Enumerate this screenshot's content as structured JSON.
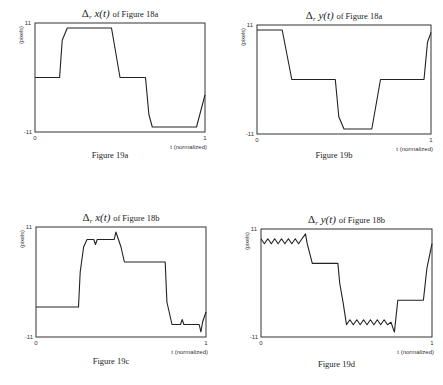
{
  "chart_data": [
    {
      "type": "line",
      "title": "Δr x(t) of Figure 18a",
      "title_var": "x",
      "title_ref": "of Figure 18a",
      "caption": "Figure 19a",
      "xlabel": "t (normalized)",
      "ylabel": "(pixels)",
      "xlim": [
        0,
        1
      ],
      "ylim": [
        -11,
        11
      ],
      "x_ticks": [
        "0",
        "1"
      ],
      "y_ticks": [
        "11",
        "-11"
      ],
      "grid": false,
      "box": {
        "x": 35,
        "y": 23,
        "w": 170,
        "h": 109
      },
      "x": [
        0,
        0.145,
        0.16,
        0.19,
        0.45,
        0.5,
        0.65,
        0.67,
        0.69,
        0.95,
        1
      ],
      "y": [
        0,
        0,
        7.5,
        10,
        10,
        0,
        0,
        -7.5,
        -10,
        -10,
        -3.5
      ]
    },
    {
      "type": "line",
      "title": "Δr y(t) of Figure 18a",
      "title_var": "y",
      "title_ref": "of Figure 18a",
      "caption": "Figure 19b",
      "xlabel": "t (normalized)",
      "ylabel": "(pixels)",
      "xlim": [
        0,
        1
      ],
      "ylim": [
        -11,
        11
      ],
      "x_ticks": [
        "0",
        "1"
      ],
      "y_ticks": [
        "11",
        "-11"
      ],
      "grid": false,
      "box": {
        "x": 257,
        "y": 25,
        "w": 174,
        "h": 109
      },
      "x": [
        0,
        0.145,
        0.2,
        0.45,
        0.47,
        0.5,
        0.66,
        0.71,
        0.96,
        0.98,
        1
      ],
      "y": [
        10,
        10,
        0,
        0,
        -7.5,
        -10,
        -10,
        0,
        0,
        7.5,
        9.5
      ]
    },
    {
      "type": "line",
      "title": "Δr x(t) of Figure 18b",
      "title_var": "x",
      "title_ref": "of Figure 18b",
      "caption": "Figure 19c",
      "xlabel": "t (normalized)",
      "ylabel": "(pixels)",
      "xlim": [
        0,
        1
      ],
      "ylim": [
        -11,
        11
      ],
      "x_ticks": [
        "0",
        "1"
      ],
      "y_ticks": [
        "11",
        "-11"
      ],
      "grid": false,
      "box": {
        "x": 36,
        "y": 227,
        "w": 170,
        "h": 110
      },
      "x": [
        0,
        0.25,
        0.26,
        0.28,
        0.3,
        0.34,
        0.35,
        0.36,
        0.46,
        0.47,
        0.5,
        0.52,
        0.76,
        0.77,
        0.8,
        0.85,
        0.86,
        0.87,
        0.96,
        0.97,
        0.98,
        1
      ],
      "y": [
        -5,
        -5,
        2,
        7,
        8.5,
        8.5,
        7.5,
        8.5,
        8.5,
        10,
        7,
        4,
        4,
        -4,
        -8.5,
        -8.5,
        -7.5,
        -8.5,
        -8.5,
        -10,
        -8,
        -6
      ]
    },
    {
      "type": "line",
      "title": "Δr y(t) of Figure 18b",
      "title_var": "y",
      "title_ref": "of Figure 18b",
      "caption": "Figure 19d",
      "xlabel": "t (normalized)",
      "ylabel": "(pixels)",
      "xlim": [
        0,
        1
      ],
      "ylim": [
        -11,
        11
      ],
      "x_ticks": [
        "0",
        "1"
      ],
      "y_ticks": [
        "11",
        "-11"
      ],
      "grid": false,
      "box": {
        "x": 261,
        "y": 229,
        "w": 171,
        "h": 108
      },
      "x": [
        0,
        0.02,
        0.04,
        0.06,
        0.08,
        0.1,
        0.12,
        0.14,
        0.16,
        0.18,
        0.2,
        0.22,
        0.24,
        0.26,
        0.27,
        0.3,
        0.45,
        0.46,
        0.48,
        0.5,
        0.52,
        0.54,
        0.56,
        0.58,
        0.6,
        0.62,
        0.64,
        0.66,
        0.68,
        0.7,
        0.72,
        0.74,
        0.76,
        0.78,
        0.8,
        0.95,
        0.97,
        1
      ],
      "y": [
        9,
        8,
        9,
        8,
        9,
        8,
        9,
        8,
        9,
        8,
        9,
        8,
        9,
        10,
        8,
        4,
        4,
        0,
        -4,
        -8.5,
        -7.5,
        -8.5,
        -7.5,
        -8.5,
        -7.5,
        -8.5,
        -7.5,
        -8.5,
        -7.5,
        -8.5,
        -7.5,
        -8.5,
        -8,
        -10,
        -3.5,
        -3.5,
        3,
        8
      ]
    }
  ],
  "captions": [
    "Figure 19a",
    "Figure 19b",
    "Figure 19c",
    "Figure 19d"
  ]
}
